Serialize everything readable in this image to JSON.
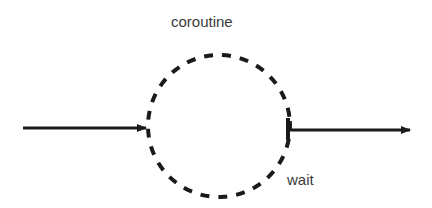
{
  "diagram": {
    "title_label": "coroutine",
    "exit_label": "wait",
    "colors": {
      "stroke": "#1a1a1a",
      "text": "#3a3a3a",
      "background": "#ffffff"
    },
    "nodes": [
      {
        "id": "coroutine",
        "shape": "circle",
        "style": "dashed",
        "label": "coroutine"
      }
    ],
    "edges": [
      {
        "id": "entry-arrow",
        "direction": "into coroutine",
        "label": ""
      },
      {
        "id": "exit-arrow",
        "direction": "out of coroutine",
        "label": "wait"
      }
    ]
  }
}
